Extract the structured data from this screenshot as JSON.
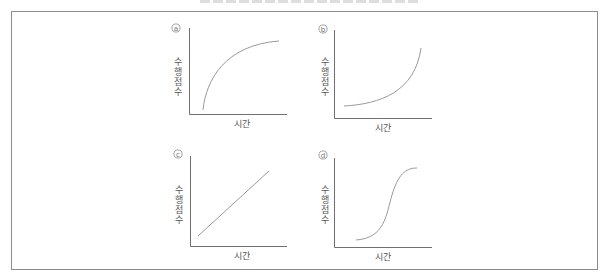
{
  "figure": {
    "panels": [
      {
        "id": "a",
        "marker": "a",
        "ylabel_chars": [
          "수",
          "행",
          "점",
          "수"
        ],
        "xlabel": "시간",
        "shape": "concave-increasing (rapid rise then plateau)"
      },
      {
        "id": "b",
        "marker": "b",
        "ylabel_chars": [
          "수",
          "행",
          "점",
          "수"
        ],
        "xlabel": "시간",
        "shape": "convex-increasing (slow start then rapid rise)"
      },
      {
        "id": "c",
        "marker": "c",
        "ylabel_chars": [
          "수",
          "행",
          "점",
          "수"
        ],
        "xlabel": "시간",
        "shape": "linear-increasing"
      },
      {
        "id": "d",
        "marker": "d",
        "ylabel_chars": [
          "수",
          "행",
          "점",
          "수"
        ],
        "xlabel": "시간",
        "shape": "s-shaped (sigmoid)"
      }
    ],
    "colors": {
      "frame": "#8c8c8c",
      "axis": "#707070",
      "curve": "#9a9a9a",
      "text": "#555555"
    }
  }
}
